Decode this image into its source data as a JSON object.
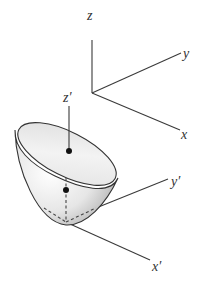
{
  "figure": {
    "world_axes": {
      "labels": {
        "z": "z",
        "y": "y",
        "x": "x"
      }
    },
    "body_axes": {
      "labels": {
        "z": "z′",
        "y": "y′",
        "x": "x′"
      }
    },
    "points": [
      {
        "name": "rim-center-point"
      },
      {
        "name": "center-of-mass-point"
      }
    ],
    "colors": {
      "line": "#3a3a3a",
      "surface_light": "#f4f4f4",
      "surface_dark": "#bdbdbd",
      "dot": "#111111"
    }
  }
}
